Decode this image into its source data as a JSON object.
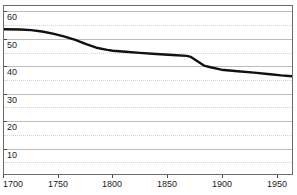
{
  "chart_data": {
    "type": "line",
    "title": "",
    "subtitle": "",
    "xlabel": "",
    "ylabel": "",
    "xlim": [
      1700,
      1965
    ],
    "ylim": [
      0,
      62
    ],
    "grid": true,
    "legend": false,
    "legend_position": "none",
    "x_ticks": [
      1700,
      1750,
      1800,
      1850,
      1900,
      1950
    ],
    "x_tick_labels": [
      "1700",
      "1750",
      "1800",
      "1850",
      "1900",
      "1950"
    ],
    "y_ticks": [
      10,
      20,
      30,
      40,
      50,
      60
    ],
    "y_tick_labels": [
      "10",
      "20",
      "30",
      "40",
      "50",
      "60"
    ],
    "y_minor_ticks": [
      5,
      15,
      25,
      35,
      45,
      55
    ],
    "series": [
      {
        "name": "series-1",
        "color": "#111111",
        "line_width": 2.4,
        "x": [
          1700,
          1715,
          1725,
          1735,
          1745,
          1755,
          1765,
          1775,
          1785,
          1795,
          1800,
          1812,
          1825,
          1840,
          1855,
          1868,
          1872,
          1878,
          1884,
          1890,
          1900,
          1915,
          1930,
          1945,
          1955,
          1965
        ],
        "y": [
          53.4,
          53.3,
          53.1,
          52.6,
          51.8,
          50.8,
          49.6,
          48.0,
          46.6,
          45.8,
          45.5,
          45.1,
          44.7,
          44.3,
          43.9,
          43.6,
          43.2,
          41.6,
          40.0,
          39.4,
          38.5,
          37.9,
          37.4,
          36.8,
          36.4,
          36.1
        ]
      }
    ],
    "annotations": []
  },
  "colors": {
    "line": "#111111",
    "grid_major": "#bdbdbd",
    "grid_minor": "#d2d2d2",
    "frame": "#6b6b6b",
    "text": "#1c1c1c",
    "background": "#ffffff"
  }
}
